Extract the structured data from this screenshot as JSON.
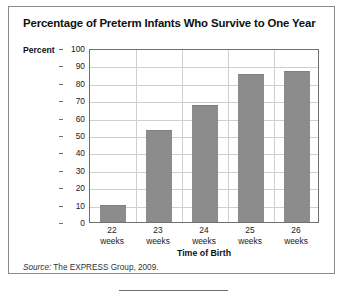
{
  "chart_data": {
    "type": "bar",
    "title": "Percentage of Preterm Infants Who Survive to One Year",
    "categories": [
      "22 weeks",
      "23 weeks",
      "24 weeks",
      "25 weeks",
      "26 weeks"
    ],
    "category_lines": [
      [
        "22",
        "weeks"
      ],
      [
        "23",
        "weeks"
      ],
      [
        "24",
        "weeks"
      ],
      [
        "25",
        "weeks"
      ],
      [
        "26",
        "weeks"
      ]
    ],
    "values": [
      10,
      53,
      67,
      85,
      87
    ],
    "xlabel": "Time of Birth",
    "ylabel": "Percent",
    "ylim": [
      0,
      100
    ],
    "ytick_step": 10,
    "yticks": [
      100,
      90,
      80,
      70,
      60,
      50,
      40,
      30,
      20,
      10,
      0
    ],
    "grid": true,
    "legend": false,
    "bar_color": "#8c8c8c",
    "grid_color": "#cfcfcf",
    "axis_color": "#6f6f6f"
  },
  "source": {
    "label": "Source:",
    "text": " The EXPRESS Group, 2009."
  }
}
